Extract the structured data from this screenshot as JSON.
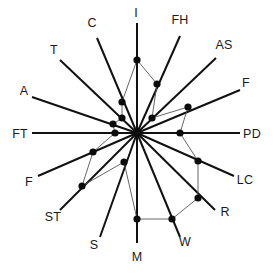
{
  "chart_data": {
    "type": "radar",
    "title": "",
    "subtitle": "",
    "xlabel": "",
    "ylabel": "",
    "grid": false,
    "legend": "none",
    "center": {
      "x": 137,
      "y": 133
    },
    "axis_length": 112,
    "value_range": [
      0,
      1
    ],
    "categories": [
      "I",
      "FH",
      "AS",
      "F",
      "PD",
      "LC",
      "R",
      "W",
      "M",
      "S",
      "ST",
      "F",
      "FT",
      "A",
      "T",
      "C"
    ],
    "axis_angles_deg": [
      90,
      67.5,
      45,
      22.5,
      0,
      -22.5,
      -45,
      -67.5,
      -90,
      -112.5,
      -135,
      -157.5,
      180,
      157.5,
      135,
      112.5
    ],
    "series": [
      {
        "name": "profile",
        "values": [
          0.655,
          0.475,
          0.145,
          0.475,
          0.385,
          0.555,
          0.615,
          0.77,
          0.77,
          0.2,
          0.52,
          0.415,
          0.2,
          0.225,
          0.145,
          0.3
        ]
      }
    ],
    "points": [
      {
        "label": "I",
        "value": 0.655,
        "px": 137,
        "py": 60
      },
      {
        "label": "FH",
        "value": 0.475,
        "px": 157,
        "py": 84
      },
      {
        "label": "AS",
        "value": 0.145,
        "px": 152,
        "py": 118
      },
      {
        "label": "F",
        "value": 0.475,
        "px": 188,
        "py": 107
      },
      {
        "label": "PD",
        "value": 0.385,
        "px": 180,
        "py": 133
      },
      {
        "label": "LC",
        "value": 0.555,
        "px": 198,
        "py": 161
      },
      {
        "label": "R",
        "value": 0.615,
        "px": 198,
        "py": 198
      },
      {
        "label": "W",
        "value": 0.77,
        "px": 172,
        "py": 219
      },
      {
        "label": "M",
        "value": 0.77,
        "px": 137,
        "py": 219
      },
      {
        "label": "S",
        "value": 0.2,
        "px": 124,
        "py": 162
      },
      {
        "label": "ST",
        "value": 0.52,
        "px": 82,
        "py": 186
      },
      {
        "label": "F2",
        "value": 0.415,
        "px": 93,
        "py": 152
      },
      {
        "label": "FT",
        "value": 0.2,
        "px": 115,
        "py": 133
      },
      {
        "label": "A",
        "value": 0.225,
        "px": 113,
        "py": 124
      },
      {
        "label": "T",
        "value": 0.145,
        "px": 122,
        "py": 118
      },
      {
        "label": "C",
        "value": 0.3,
        "px": 122,
        "py": 102
      }
    ]
  },
  "axes": [
    {
      "key": "I",
      "label": "I",
      "label_x": 136,
      "label_y": 17,
      "anchor": "middle",
      "end_x": 137,
      "end_y": 23
    },
    {
      "key": "FH",
      "label": "FH",
      "label_x": 180,
      "label_y": 24,
      "anchor": "middle",
      "end_x": 180,
      "end_y": 36
    },
    {
      "key": "AS",
      "label": "AS",
      "label_x": 224,
      "label_y": 49,
      "anchor": "middle",
      "end_x": 216,
      "end_y": 58
    },
    {
      "key": "F",
      "label": "F",
      "label_x": 246,
      "label_y": 87,
      "anchor": "middle",
      "end_x": 240,
      "end_y": 90
    },
    {
      "key": "PD",
      "label": "PD",
      "label_x": 252,
      "label_y": 138,
      "anchor": "middle",
      "end_x": 240,
      "end_y": 133
    },
    {
      "key": "LC",
      "label": "LC",
      "label_x": 245,
      "label_y": 184,
      "anchor": "middle",
      "end_x": 234,
      "end_y": 176
    },
    {
      "key": "R",
      "label": "R",
      "label_x": 225,
      "label_y": 216,
      "anchor": "middle",
      "end_x": 215,
      "end_y": 210
    },
    {
      "key": "W",
      "label": "W",
      "label_x": 185,
      "label_y": 246,
      "anchor": "middle",
      "end_x": 180,
      "end_y": 237
    },
    {
      "key": "M",
      "label": "M",
      "label_x": 137,
      "label_y": 261,
      "anchor": "middle",
      "end_x": 137,
      "end_y": 243
    },
    {
      "key": "S",
      "label": "S",
      "label_x": 94,
      "label_y": 249,
      "anchor": "middle",
      "end_x": 100,
      "end_y": 237
    },
    {
      "key": "ST",
      "label": "ST",
      "label_x": 53,
      "label_y": 221,
      "anchor": "middle",
      "end_x": 60,
      "end_y": 210
    },
    {
      "key": "F2",
      "label": "F",
      "label_x": 29,
      "label_y": 186,
      "anchor": "middle",
      "end_x": 38,
      "end_y": 176
    },
    {
      "key": "FT",
      "label": "FT",
      "label_x": 20,
      "label_y": 138,
      "anchor": "middle",
      "end_x": 32,
      "end_y": 133
    },
    {
      "key": "A",
      "label": "A",
      "label_x": 24,
      "label_y": 95,
      "anchor": "middle",
      "end_x": 32,
      "end_y": 97
    },
    {
      "key": "T",
      "label": "T",
      "label_x": 54,
      "label_y": 54,
      "anchor": "middle",
      "end_x": 60,
      "end_y": 60
    },
    {
      "key": "C",
      "label": "C",
      "label_x": 92,
      "label_y": 27,
      "anchor": "middle",
      "end_x": 97,
      "end_y": 38
    }
  ],
  "colors": {
    "axis": "#111111",
    "polygon": "#555555",
    "point": "#0c0c0c",
    "background": "#ffffff",
    "label": "#1a1a1a"
  }
}
